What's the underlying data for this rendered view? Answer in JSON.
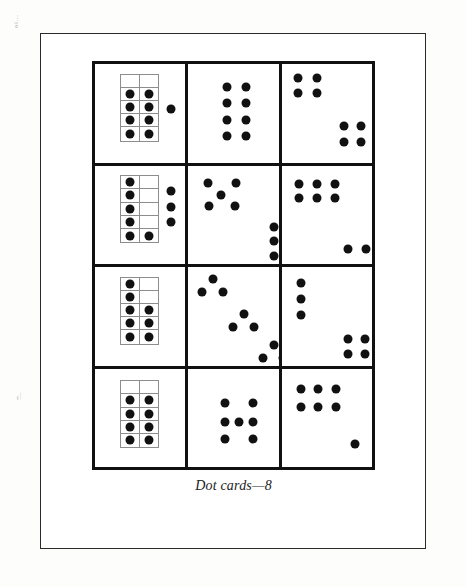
{
  "document": {
    "caption": "Dot cards—8",
    "margin_marks": [
      "ɵɨ…",
      "͡͡—"
    ],
    "colors": {
      "dot": "#111111",
      "card_border": "#111111",
      "ten_frame_border": "#8d8d8d",
      "sheet_border": "#2a2a2a",
      "paper": "#ffffff",
      "scan_background": "#fdfdfb"
    }
  },
  "grid": {
    "rows": 4,
    "columns": 3,
    "cards": [
      {
        "id": "card-r1c1",
        "name": "ten-frame-8-plus-1",
        "total_dots": 9,
        "ten_frame": {
          "columns": 2,
          "rows": 5,
          "filled": [
            0,
            0,
            1,
            1,
            1,
            1,
            1,
            1,
            1,
            1
          ],
          "filled_count": 8,
          "x": 26,
          "y": 10,
          "w": 40,
          "h": 70
        },
        "loose_dots": [
          {
            "x": 78,
            "y": 46
          }
        ]
      },
      {
        "id": "card-r1c2",
        "name": "two-by-four-block",
        "total_dots": 8,
        "ten_frame": null,
        "loose_dots": [
          {
            "x": 40,
            "y": 24
          },
          {
            "x": 60,
            "y": 24
          },
          {
            "x": 40,
            "y": 40
          },
          {
            "x": 60,
            "y": 40
          },
          {
            "x": 40,
            "y": 58
          },
          {
            "x": 60,
            "y": 58
          },
          {
            "x": 40,
            "y": 74
          },
          {
            "x": 60,
            "y": 74
          }
        ]
      },
      {
        "id": "card-r1c3",
        "name": "two-squares-diagonal",
        "total_dots": 8,
        "ten_frame": null,
        "loose_dots": [
          {
            "x": 17,
            "y": 14
          },
          {
            "x": 36,
            "y": 14
          },
          {
            "x": 17,
            "y": 30
          },
          {
            "x": 36,
            "y": 30
          },
          {
            "x": 64,
            "y": 64
          },
          {
            "x": 82,
            "y": 64
          },
          {
            "x": 64,
            "y": 80
          },
          {
            "x": 82,
            "y": 80
          }
        ]
      },
      {
        "id": "card-r2c1",
        "name": "ten-frame-6-plus-3",
        "total_dots": 9,
        "ten_frame": {
          "columns": 2,
          "rows": 5,
          "filled": [
            1,
            0,
            1,
            0,
            1,
            0,
            1,
            0,
            1,
            1
          ],
          "filled_count": 6,
          "x": 26,
          "y": 10,
          "w": 40,
          "h": 70
        },
        "loose_dots": [
          {
            "x": 79,
            "y": 26
          },
          {
            "x": 79,
            "y": 43
          },
          {
            "x": 79,
            "y": 58
          }
        ]
      },
      {
        "id": "card-r2c2",
        "name": "quincunx-five-plus-three",
        "total_dots": 8,
        "ten_frame": null,
        "loose_dots": [
          {
            "x": 20,
            "y": 18
          },
          {
            "x": 49,
            "y": 18
          },
          {
            "x": 34,
            "y": 30
          },
          {
            "x": 21,
            "y": 42
          },
          {
            "x": 48,
            "y": 42
          },
          {
            "x": 88,
            "y": 63
          },
          {
            "x": 88,
            "y": 78
          },
          {
            "x": 88,
            "y": 93
          }
        ]
      },
      {
        "id": "card-r2c3",
        "name": "six-block-plus-two",
        "total_dots": 8,
        "ten_frame": null,
        "loose_dots": [
          {
            "x": 18,
            "y": 19
          },
          {
            "x": 37,
            "y": 19
          },
          {
            "x": 55,
            "y": 19
          },
          {
            "x": 18,
            "y": 33
          },
          {
            "x": 37,
            "y": 33
          },
          {
            "x": 55,
            "y": 33
          },
          {
            "x": 68,
            "y": 86
          },
          {
            "x": 87,
            "y": 86
          }
        ]
      },
      {
        "id": "card-r3c1",
        "name": "ten-frame-eight-L-shape",
        "total_dots": 8,
        "ten_frame": {
          "columns": 2,
          "rows": 5,
          "filled": [
            1,
            0,
            1,
            0,
            1,
            1,
            1,
            1,
            1,
            1
          ],
          "filled_count": 8,
          "x": 26,
          "y": 10,
          "w": 40,
          "h": 70
        },
        "loose_dots": []
      },
      {
        "id": "card-r3c2",
        "name": "three-triangles-diagonal",
        "total_dots": 9,
        "ten_frame": null,
        "loose_dots": [
          {
            "x": 25,
            "y": 12
          },
          {
            "x": 14,
            "y": 26
          },
          {
            "x": 36,
            "y": 26
          },
          {
            "x": 57,
            "y": 48
          },
          {
            "x": 46,
            "y": 62
          },
          {
            "x": 68,
            "y": 62
          },
          {
            "x": 88,
            "y": 80
          },
          {
            "x": 77,
            "y": 94
          },
          {
            "x": 98,
            "y": 94
          }
        ]
      },
      {
        "id": "card-r3c3",
        "name": "three-column-plus-square",
        "total_dots": 7,
        "ten_frame": null,
        "loose_dots": [
          {
            "x": 20,
            "y": 16
          },
          {
            "x": 20,
            "y": 33
          },
          {
            "x": 20,
            "y": 49
          },
          {
            "x": 68,
            "y": 74
          },
          {
            "x": 86,
            "y": 74
          },
          {
            "x": 68,
            "y": 90
          },
          {
            "x": 86,
            "y": 90
          }
        ]
      },
      {
        "id": "card-r4c1",
        "name": "ten-frame-eight-block",
        "total_dots": 8,
        "ten_frame": {
          "columns": 2,
          "rows": 5,
          "filled": [
            0,
            0,
            1,
            1,
            1,
            1,
            1,
            1,
            1,
            1
          ],
          "filled_count": 8,
          "x": 26,
          "y": 12,
          "w": 40,
          "h": 70
        },
        "loose_dots": []
      },
      {
        "id": "card-r4c2",
        "name": "seven-plus-pattern",
        "total_dots": 7,
        "ten_frame": null,
        "loose_dots": [
          {
            "x": 38,
            "y": 36
          },
          {
            "x": 67,
            "y": 36
          },
          {
            "x": 38,
            "y": 55
          },
          {
            "x": 52,
            "y": 55
          },
          {
            "x": 67,
            "y": 55
          },
          {
            "x": 38,
            "y": 73
          },
          {
            "x": 67,
            "y": 73
          }
        ]
      },
      {
        "id": "card-r4c3",
        "name": "six-block-plus-one",
        "total_dots": 7,
        "ten_frame": null,
        "loose_dots": [
          {
            "x": 20,
            "y": 21
          },
          {
            "x": 38,
            "y": 21
          },
          {
            "x": 56,
            "y": 21
          },
          {
            "x": 20,
            "y": 40
          },
          {
            "x": 38,
            "y": 40
          },
          {
            "x": 56,
            "y": 40
          },
          {
            "x": 76,
            "y": 78
          }
        ]
      }
    ]
  }
}
